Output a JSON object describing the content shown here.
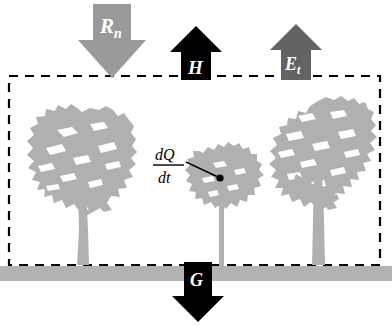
{
  "figure": {
    "colors": {
      "background": "#ffffff",
      "tree": "#b0b0b0",
      "ground": "#b3b3b3",
      "net_radiation_arrow": "#9a9a9a",
      "sensible_heat_arrow": "#000000",
      "evapotranspiration_arrow": "#636363",
      "ground_heat_arrow": "#000000",
      "control_volume_border": "#000000",
      "label_text": "#ffffff",
      "annotation_text": "#000000"
    },
    "arrows": [
      {
        "name": "net-radiation",
        "symbol": "R",
        "subscript": "n",
        "direction": "down",
        "color": "#9a9a9a"
      },
      {
        "name": "sensible-heat",
        "symbol": "H",
        "subscript": "",
        "direction": "up",
        "color": "#000000"
      },
      {
        "name": "evapotranspiration",
        "symbol": "E",
        "subscript": "t",
        "direction": "up",
        "color": "#636363"
      },
      {
        "name": "ground-heat-flux",
        "symbol": "G",
        "subscript": "",
        "direction": "down",
        "color": "#000000"
      }
    ],
    "annotation": {
      "name": "heat-storage-change",
      "numerator": "dQ",
      "denominator": "dt"
    },
    "trees": [
      {
        "name": "left-tree"
      },
      {
        "name": "middle-tree"
      },
      {
        "name": "right-tree"
      }
    ],
    "ground": {
      "name": "ground-surface"
    },
    "control_volume": {
      "name": "control-volume-boundary",
      "style": "dashed"
    }
  }
}
